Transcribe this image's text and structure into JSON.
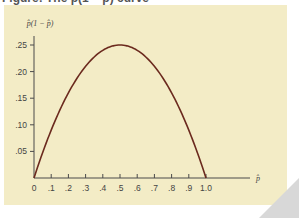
{
  "caption": "Figure: The p̂(1 − p̂) curve",
  "colors": {
    "panel_background": "#f3ecc6",
    "curve": "#6b2a1e",
    "axis": "#4a4a4a",
    "text": "#444444"
  },
  "chart_data": {
    "type": "line",
    "title": "",
    "xlabel": "p̂",
    "ylabel": "p̂(1 − p̂)",
    "xlim": [
      0,
      1.0
    ],
    "ylim": [
      0,
      0.25
    ],
    "grid": false,
    "legend": null,
    "x_ticks": [
      "0",
      ".1",
      ".2",
      ".3",
      ".4",
      ".5",
      ".6",
      ".7",
      ".8",
      ".9",
      "1.0"
    ],
    "y_ticks": [
      ".05",
      ".10",
      ".15",
      ".20",
      ".25"
    ],
    "series": [
      {
        "name": "p̂(1 − p̂)",
        "x": [
          0,
          0.1,
          0.2,
          0.3,
          0.4,
          0.5,
          0.6,
          0.7,
          0.8,
          0.9,
          1.0
        ],
        "y": [
          0,
          0.09,
          0.16,
          0.21,
          0.24,
          0.25,
          0.24,
          0.21,
          0.16,
          0.09,
          0
        ]
      }
    ]
  }
}
